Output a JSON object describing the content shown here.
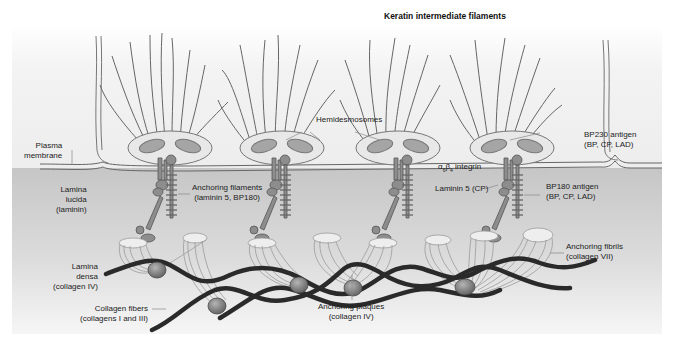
{
  "title": "Keratin intermediate filaments",
  "labels": {
    "plasma_membrane": [
      "Plasma",
      "membrane"
    ],
    "lamina_lucida": [
      "Lamina",
      "lucida",
      "(laminin)"
    ],
    "lamina_densa": [
      "Lamina",
      "densa",
      "(collagen IV)"
    ],
    "collagen_fibers": [
      "Collagen fibers",
      "(collagens I and III)"
    ],
    "anchoring_filaments": [
      "Anchoring filaments",
      "(laminin 5, BP180)"
    ],
    "hemidesmosomes": "Hemidesmosomes",
    "integrin": "α6β4 integrin",
    "integrin_alpha": "α",
    "integrin_alpha_sub": "6",
    "integrin_beta": "β",
    "integrin_beta_sub": "4",
    "integrin_word": " integrin",
    "laminin5": "Laminin 5 (CP)",
    "bp230": [
      "BP230 antigen",
      "(BP, CP, LAD)"
    ],
    "bp180": [
      "BP180 antigen",
      "(BP, CP, LAD)"
    ],
    "anchoring_fibrils": [
      "Anchoring fibrils",
      "(collagen VII)"
    ],
    "anchoring_plaques": [
      "Anchoring plaques",
      "(collagen IV)"
    ]
  },
  "colors": {
    "background": "#ffffff",
    "cell_region": "#f2f2f2",
    "dermis_top": "#c9c9c9",
    "dermis_bottom": "#f3f3f3",
    "hemidesmosome_fill": "#e6e6e6",
    "plaque_inner": "#a8a8a8",
    "filament": "#6a6a6a",
    "collagen_fiber": "#2a2a2a",
    "anchoring_plaque": "#7f7f7f",
    "protein": "#8a8a8a"
  }
}
